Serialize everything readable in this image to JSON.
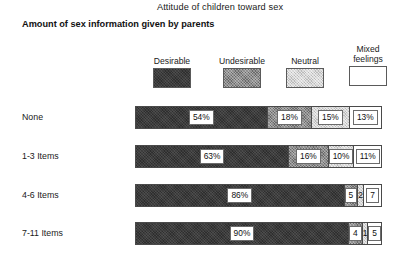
{
  "title": "Attitude of children toward sex",
  "axis_heading": "Amount of\nsex information\ngiven by parents",
  "legend": {
    "items": [
      {
        "label": "Desirable",
        "key": "desirable",
        "color": "#3b3b3b"
      },
      {
        "label": "Undesirable",
        "key": "undesirable",
        "color": "#8d8d8d"
      },
      {
        "label": "Neutral",
        "key": "neutral",
        "color": "#d6d6d6"
      },
      {
        "label": "Mixed\nfeelings",
        "key": "mixed",
        "color": "#ffffff"
      }
    ]
  },
  "chart_data": {
    "type": "bar",
    "title": "Attitude of children toward sex",
    "xlabel": "",
    "ylabel": "Amount of sex information given by parents",
    "stacked": true,
    "orientation": "horizontal",
    "grid": false,
    "legend_position": "top",
    "xlim": [
      0,
      100
    ],
    "categories": [
      "None",
      "1-3 Items",
      "4-6 Items",
      "7-11 Items"
    ],
    "series": [
      {
        "name": "Desirable",
        "values": [
          54,
          63,
          86,
          90
        ]
      },
      {
        "name": "Undesirable",
        "values": [
          18,
          16,
          5,
          4
        ]
      },
      {
        "name": "Neutral",
        "values": [
          15,
          10,
          2,
          1
        ]
      },
      {
        "name": "Mixed feelings",
        "values": [
          13,
          11,
          7,
          5
        ]
      }
    ],
    "rows": [
      {
        "label": "None",
        "segments": [
          {
            "series": "Desirable",
            "value": 54,
            "display": "54%"
          },
          {
            "series": "Undesirable",
            "value": 18,
            "display": "18%"
          },
          {
            "series": "Neutral",
            "value": 15,
            "display": "15%"
          },
          {
            "series": "Mixed feelings",
            "value": 13,
            "display": "13%"
          }
        ]
      },
      {
        "label": "1-3 Items",
        "segments": [
          {
            "series": "Desirable",
            "value": 63,
            "display": "63%"
          },
          {
            "series": "Undesirable",
            "value": 16,
            "display": "16%"
          },
          {
            "series": "Neutral",
            "value": 10,
            "display": "10%"
          },
          {
            "series": "Mixed feelings",
            "value": 11,
            "display": "11%"
          }
        ]
      },
      {
        "label": "4-6 Items",
        "segments": [
          {
            "series": "Desirable",
            "value": 86,
            "display": "86%"
          },
          {
            "series": "Undesirable",
            "value": 5,
            "display": "5"
          },
          {
            "series": "Neutral",
            "value": 2,
            "display": "2"
          },
          {
            "series": "Mixed feelings",
            "value": 7,
            "display": "7"
          }
        ]
      },
      {
        "label": "7-11 Items",
        "segments": [
          {
            "series": "Desirable",
            "value": 90,
            "display": "90%"
          },
          {
            "series": "Undesirable",
            "value": 4,
            "display": "4"
          },
          {
            "series": "Neutral",
            "value": 1,
            "display": "1"
          },
          {
            "series": "Mixed feelings",
            "value": 5,
            "display": "5"
          }
        ]
      }
    ]
  }
}
